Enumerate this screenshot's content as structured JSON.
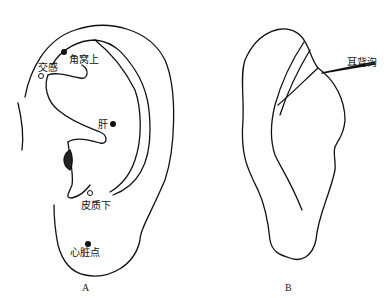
{
  "figure": {
    "panels": [
      {
        "id": "A",
        "caption": "A",
        "points": [
          {
            "label": "角窝上",
            "marker": "filled"
          },
          {
            "label": "交感",
            "marker": "hollow"
          },
          {
            "label": "肝",
            "marker": "filled"
          },
          {
            "label": "皮质下",
            "marker": "hollow"
          },
          {
            "label": "心脏点",
            "marker": "filled"
          }
        ]
      },
      {
        "id": "B",
        "caption": "B",
        "annotations": [
          {
            "label": "耳背沟"
          }
        ]
      }
    ]
  }
}
